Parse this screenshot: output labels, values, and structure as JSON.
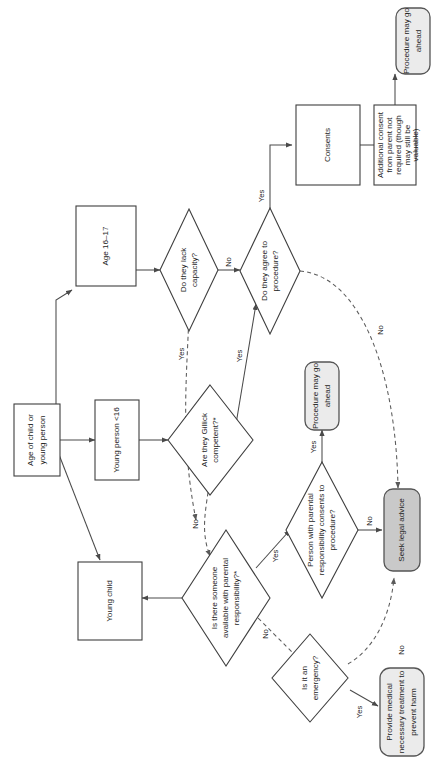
{
  "diagram": {
    "orientation": "rotated-90",
    "colors": {
      "node_fill": "#ffffff",
      "terminal_fill": "#ebebeb",
      "terminal_dark_fill": "#c9c9c9",
      "stroke": "#3f3f3f",
      "text": "#1d1d1d"
    },
    "nodes": [
      {
        "id": "start",
        "shape": "rect",
        "lines": [
          "Age of child or",
          "young person"
        ]
      },
      {
        "id": "age16",
        "shape": "rect",
        "lines": [
          "Age 16–17"
        ]
      },
      {
        "id": "young_person",
        "shape": "rect",
        "lines": [
          "Young person <16"
        ]
      },
      {
        "id": "young_child",
        "shape": "rect",
        "lines": [
          "Young child"
        ]
      },
      {
        "id": "lack_capacity",
        "shape": "diamond",
        "lines": [
          "Do they lack",
          "capacity?"
        ]
      },
      {
        "id": "agree",
        "shape": "diamond",
        "lines": [
          "Do they agree to",
          "procedure?"
        ]
      },
      {
        "id": "gillick",
        "shape": "diamond",
        "lines": [
          "Are they Gillick",
          "competent?*"
        ]
      },
      {
        "id": "someone_pr",
        "shape": "diamond",
        "lines": [
          "Is there someone",
          "available with parental",
          "responsibility?*"
        ]
      },
      {
        "id": "pr_consents",
        "shape": "diamond",
        "lines": [
          "Person with parental",
          "responsibility consents to",
          "procedure?"
        ]
      },
      {
        "id": "emergency",
        "shape": "diamond",
        "lines": [
          "Is it an",
          "emergency?"
        ]
      },
      {
        "id": "consents",
        "shape": "rect",
        "lines": [
          "Consents"
        ]
      },
      {
        "id": "additional",
        "shape": "rect",
        "lines": [
          "Additional consent",
          "from parent not",
          "required (though",
          "may still be",
          "valuable)"
        ]
      },
      {
        "id": "proceed_top",
        "shape": "round",
        "lines": [
          "Procedure may go",
          "ahead"
        ]
      },
      {
        "id": "proceed_mid",
        "shape": "round",
        "lines": [
          "Procedure may go",
          "ahead"
        ]
      },
      {
        "id": "seek_legal",
        "shape": "round-dark",
        "lines": [
          "Seek legal advice"
        ]
      },
      {
        "id": "provide_med",
        "shape": "round",
        "lines": [
          "Provide medical",
          "necessary treatment to",
          "prevent harm"
        ]
      }
    ],
    "edge_labels": {
      "capacity_no": "No",
      "capacity_yes": "Yes",
      "agree_yes": "Yes",
      "agree_no": "No",
      "gillick_yes": "Yes",
      "gillick_no": "No",
      "someone_yes": "Yes",
      "someone_no": "No",
      "pr_yes": "Yes",
      "pr_no": "No",
      "emergency_yes": "Yes",
      "emergency_no": "No"
    }
  }
}
